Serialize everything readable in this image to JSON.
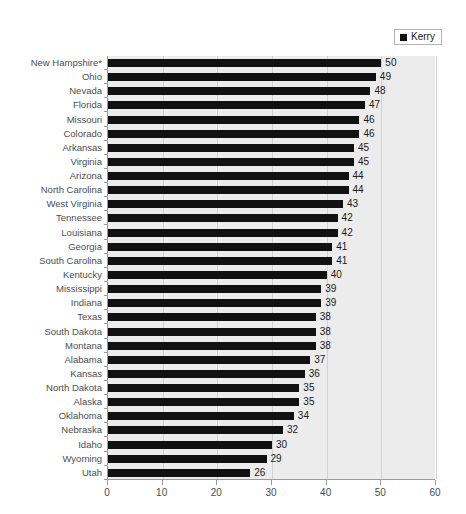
{
  "legend": {
    "entries": [
      {
        "label": "Kerry",
        "color": "#111111",
        "marker": "square"
      }
    ],
    "position": "top-right"
  },
  "colors": {
    "bar": "#111111",
    "plot_background": "#ececec",
    "gridline": "#d2d2d2",
    "axis": "#9a9a9a",
    "label_text": "#4d4d4d",
    "value_text": "#1a1a1a",
    "page_background": "#ffffff"
  },
  "chart_data": {
    "type": "bar",
    "orientation": "horizontal",
    "title": "",
    "subtitle": "",
    "xlabel": "",
    "ylabel": "",
    "xlim": [
      0,
      60
    ],
    "xticks": [
      0,
      10,
      20,
      30,
      40,
      50,
      60
    ],
    "xtick_labels": [
      "0",
      "10",
      "20",
      "30",
      "40",
      "50",
      "60"
    ],
    "grid": "vertical",
    "legend_position": "top-right",
    "data_labels": true,
    "sort": "descending",
    "series": [
      {
        "name": "Kerry",
        "color": "#111111",
        "values": [
          50,
          49,
          48,
          47,
          46,
          46,
          45,
          45,
          44,
          44,
          43,
          42,
          42,
          41,
          41,
          40,
          39,
          39,
          38,
          38,
          38,
          37,
          36,
          35,
          35,
          34,
          32,
          30,
          29,
          26
        ]
      }
    ],
    "categories": [
      "New Hampshire*",
      "Ohio",
      "Nevada",
      "Florida",
      "Missouri",
      "Colorado",
      "Arkansas",
      "Virginia",
      "Arizona",
      "North Carolina",
      "West Virginia",
      "Tennessee",
      "Louisiana",
      "Georgia",
      "South Carolina",
      "Kentucky",
      "Mississippi",
      "Indiana",
      "Texas",
      "South Dakota",
      "Montana",
      "Alabama",
      "Kansas",
      "North Dakota",
      "Alaska",
      "Oklahoma",
      "Nebraska",
      "Idaho",
      "Wyoming",
      "Utah"
    ]
  }
}
